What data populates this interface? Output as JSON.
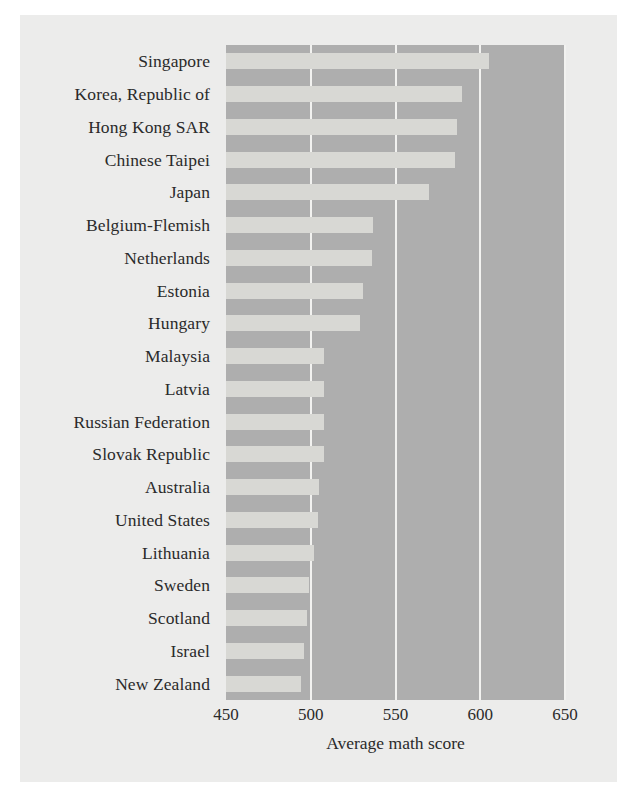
{
  "chart_data": {
    "type": "bar",
    "orientation": "horizontal",
    "title": "",
    "xlabel": "Average math score",
    "ylabel": "",
    "xlim": [
      450,
      650
    ],
    "xticks": [
      450,
      500,
      550,
      600,
      650
    ],
    "xtick_labels": [
      "450",
      "500",
      "550",
      "600",
      "650"
    ],
    "grid": "vertical-white-gridlines",
    "legend": "none",
    "colors": {
      "figure_background": "#ececeb",
      "plot_background": "#aeaeae",
      "bar": "#d8d8d4",
      "gridline": "#f2f2f0",
      "text": "#2a2a2a"
    },
    "categories": [
      "Singapore",
      "Korea, Republic of",
      "Hong Kong SAR",
      "Chinese Taipei",
      "Japan",
      "Belgium-Flemish",
      "Netherlands",
      "Estonia",
      "Hungary",
      "Malaysia",
      "Latvia",
      "Russian Federation",
      "Slovak Republic",
      "Australia",
      "United States",
      "Lithuania",
      "Sweden",
      "Scotland",
      "Israel",
      "New Zealand"
    ],
    "values": [
      605,
      589,
      586,
      585,
      570,
      537,
      536,
      531,
      529,
      508,
      508,
      508,
      508,
      505,
      504,
      502,
      499,
      498,
      496,
      494
    ]
  }
}
